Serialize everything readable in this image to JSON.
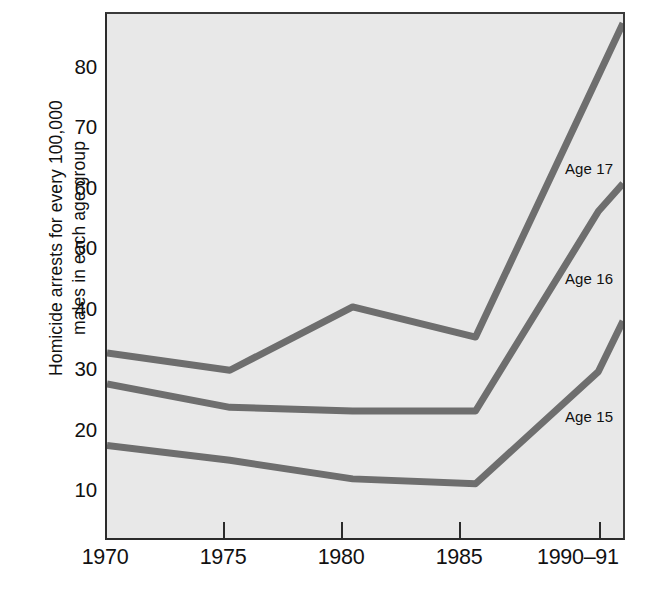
{
  "figure": {
    "background_color": "#ffffff",
    "plot_background_color": "#e8e8e8",
    "axis_color": "#2b2b2b",
    "line_color": "#6e6e6e"
  },
  "axes": {
    "ylabel": "Homicide arrests for every 100,000\nmales in each age group",
    "ytick_labels": [
      "80",
      "70",
      "60",
      "50",
      "40",
      "30",
      "20",
      "10"
    ],
    "xtick_labels": [
      "1970",
      "1975",
      "1980",
      "1985",
      "1990–91"
    ]
  },
  "annotations": {
    "age17": "Age 17",
    "age16": "Age 16",
    "age15": "Age 15"
  },
  "caption": {
    "text": ""
  },
  "chart_data": {
    "type": "line",
    "title": "",
    "subtitle": "",
    "xlabel": "",
    "ylabel": "Homicide arrests for every 100,000 males in each age group",
    "x": [
      "1970",
      "1975",
      "1980",
      "1985",
      "1990–91"
    ],
    "x_numeric": [
      1970,
      1975,
      1980,
      1985,
      1991
    ],
    "xlim": [
      1970,
      1991
    ],
    "ylim": [
      3,
      88
    ],
    "ytick_values": [
      10,
      20,
      30,
      40,
      50,
      60,
      70,
      80
    ],
    "grid": false,
    "legend": "inline-annotations-right",
    "series": [
      {
        "name": "Age 17",
        "label": "Age 17",
        "color": "#6e6e6e",
        "values": [
          33.0,
          30.2,
          40.5,
          35.6,
          86.5
        ]
      },
      {
        "name": "Age 16",
        "label": "Age 16",
        "color": "#6e6e6e",
        "values": [
          28.0,
          24.2,
          23.6,
          23.6,
          60.5
        ],
        "intermediate_point": {
          "x": 1990,
          "value": 56.0
        }
      },
      {
        "name": "Age 15",
        "label": "Age 15",
        "color": "#6e6e6e",
        "values": [
          18.0,
          15.6,
          12.6,
          11.8,
          38.2
        ],
        "intermediate_point": {
          "x": 1990,
          "value": 30.0
        }
      }
    ]
  }
}
